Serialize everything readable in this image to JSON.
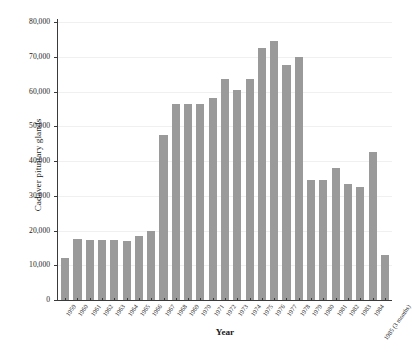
{
  "chart_data": {
    "type": "bar",
    "title": "",
    "xlabel": "Year",
    "ylabel": "Cadaver pituitary glands",
    "ylim": [
      0,
      80000
    ],
    "ytick_step": 10000,
    "ytick_labels": [
      "0",
      "10,000",
      "20,000",
      "30,000",
      "40,000",
      "50,000",
      "60,000",
      "70,000",
      "80,000"
    ],
    "ytick_values": [
      0,
      10000,
      20000,
      30000,
      40000,
      50000,
      60000,
      70000,
      80000
    ],
    "grid": true,
    "grid_axis": "y",
    "legend": false,
    "bar_color": "#9a9a9a",
    "categories": [
      "1959",
      "1960",
      "1961",
      "1962",
      "1963",
      "1964",
      "1965",
      "1966",
      "1967",
      "1968",
      "1969",
      "1970",
      "1971",
      "1972",
      "1973",
      "1974",
      "1975",
      "1976",
      "1977",
      "1978",
      "1979",
      "1980",
      "1981",
      "1982",
      "1983",
      "1984",
      "1985 (3 months)"
    ],
    "values": [
      12000,
      17500,
      17400,
      17300,
      17400,
      17000,
      18500,
      20000,
      47500,
      56500,
      56500,
      56500,
      58000,
      63500,
      60500,
      63500,
      72500,
      74500,
      67500,
      70000,
      34500,
      34500,
      38000,
      33500,
      32500,
      42500,
      13000
    ]
  }
}
